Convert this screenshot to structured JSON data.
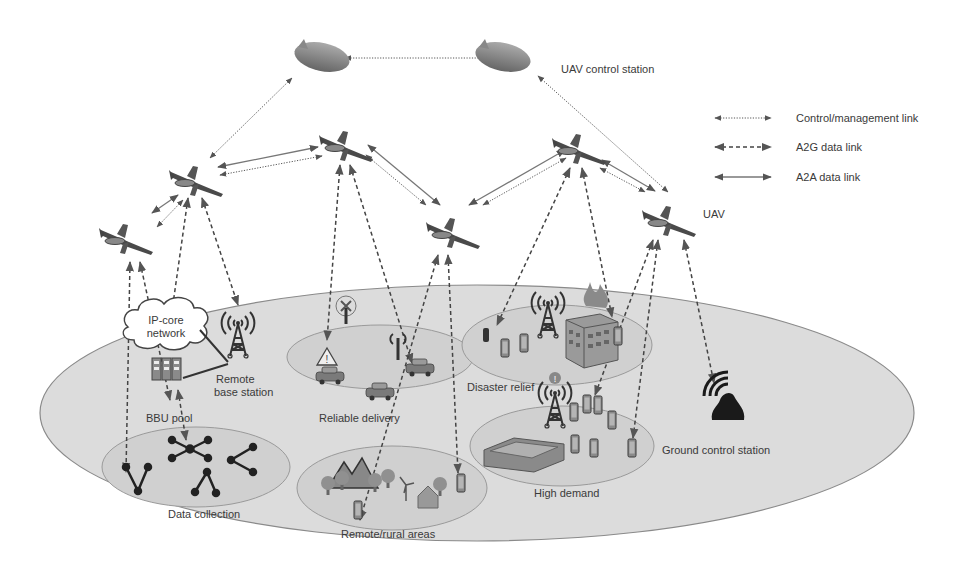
{
  "diagram": {
    "colors": {
      "ground_fill": "#dcdcdc",
      "ground_stroke": "#8a8a8a",
      "zone_fill": "#d0d0d0",
      "zone_stroke": "#9a9a9a",
      "link": "#555555",
      "icon_dark": "#3a3a3a",
      "icon_mid": "#7a7a7a",
      "text": "#3a3a3a"
    },
    "labels": {
      "uav_control_station": "UAV control station",
      "uav": "UAV",
      "ip_core_line1": "IP-core",
      "ip_core_line2": "network",
      "remote_base_station_line1": "Remote",
      "remote_base_station_line2": "base station",
      "bbu_pool": "BBU pool",
      "reliable_delivery": "Reliable delivery",
      "disaster_relief": "Disaster relief",
      "data_collection": "Data collection",
      "remote_rural_areas": "Remote/rural areas",
      "high_demand": "High demand",
      "ground_control_station": "Ground control station"
    },
    "legend": [
      {
        "type": "control",
        "label": "Control/management link"
      },
      {
        "type": "a2g",
        "label": "A2G data link"
      },
      {
        "type": "a2a",
        "label": "A2A data link"
      }
    ],
    "nodes": {
      "airships": [
        {
          "id": "airship-1",
          "x": 322,
          "y": 57
        },
        {
          "id": "airship-2",
          "x": 503,
          "y": 57
        }
      ],
      "uavs": [
        {
          "id": "uav-1",
          "x": 125,
          "y": 238
        },
        {
          "id": "uav-2",
          "x": 195,
          "y": 180
        },
        {
          "id": "uav-3",
          "x": 345,
          "y": 145
        },
        {
          "id": "uav-4",
          "x": 452,
          "y": 232
        },
        {
          "id": "uav-5",
          "x": 578,
          "y": 148
        },
        {
          "id": "uav-6",
          "x": 668,
          "y": 220
        }
      ]
    },
    "zones": [
      {
        "id": "reliable-delivery",
        "cx": 380,
        "cy": 357,
        "rx": 93,
        "ry": 32
      },
      {
        "id": "disaster-relief",
        "cx": 557,
        "cy": 345,
        "rx": 95,
        "ry": 40
      },
      {
        "id": "data-collection",
        "cx": 196,
        "cy": 467,
        "rx": 94,
        "ry": 40
      },
      {
        "id": "remote-rural",
        "cx": 392,
        "cy": 488,
        "rx": 95,
        "ry": 42
      },
      {
        "id": "high-demand",
        "cx": 562,
        "cy": 446,
        "rx": 92,
        "ry": 40
      }
    ],
    "links": [
      {
        "type": "control",
        "from": [
          345,
          58
        ],
        "to": [
          505,
          58
        ]
      },
      {
        "type": "control",
        "from": [
          292,
          78
        ],
        "to": [
          210,
          158
        ]
      },
      {
        "type": "control",
        "from": [
          538,
          76
        ],
        "to": [
          668,
          192
        ]
      },
      {
        "type": "a2a",
        "from": [
          218,
          167
        ],
        "to": [
          318,
          147
        ]
      },
      {
        "type": "control",
        "from": [
          220,
          175
        ],
        "to": [
          322,
          156
        ]
      },
      {
        "type": "a2a",
        "from": [
          178,
          195
        ],
        "to": [
          152,
          213
        ]
      },
      {
        "type": "control",
        "from": [
          183,
          200
        ],
        "to": [
          157,
          227
        ]
      },
      {
        "type": "a2a",
        "from": [
          368,
          145
        ],
        "to": [
          440,
          205
        ]
      },
      {
        "type": "control",
        "from": [
          366,
          155
        ],
        "to": [
          426,
          205
        ]
      },
      {
        "type": "a2a",
        "from": [
          565,
          150
        ],
        "to": [
          469,
          205
        ]
      },
      {
        "type": "control",
        "from": [
          566,
          158
        ],
        "to": [
          483,
          205
        ]
      },
      {
        "type": "a2a",
        "from": [
          602,
          160
        ],
        "to": [
          655,
          191
        ]
      },
      {
        "type": "control",
        "from": [
          600,
          168
        ],
        "to": [
          645,
          192
        ]
      },
      {
        "type": "a2g",
        "from": [
          130,
          262
        ],
        "to": [
          126,
          472
        ]
      },
      {
        "type": "a2g",
        "from": [
          140,
          262
        ],
        "to": [
          170,
          400
        ]
      },
      {
        "type": "a2g",
        "from": [
          188,
          198
        ],
        "to": [
          170,
          325
        ]
      },
      {
        "type": "a2g",
        "from": [
          202,
          198
        ],
        "to": [
          238,
          305
        ]
      },
      {
        "type": "a2g",
        "from": [
          178,
          390
        ],
        "to": [
          186,
          440
        ]
      },
      {
        "type": "a2g",
        "from": [
          340,
          165
        ],
        "to": [
          327,
          340
        ]
      },
      {
        "type": "a2g",
        "from": [
          350,
          165
        ],
        "to": [
          412,
          363
        ]
      },
      {
        "type": "a2g",
        "from": [
          438,
          255
        ],
        "to": [
          360,
          520
        ]
      },
      {
        "type": "a2g",
        "from": [
          448,
          255
        ],
        "to": [
          458,
          473
        ]
      },
      {
        "type": "a2g",
        "from": [
          570,
          168
        ],
        "to": [
          497,
          325
        ]
      },
      {
        "type": "a2g",
        "from": [
          582,
          168
        ],
        "to": [
          612,
          317
        ]
      },
      {
        "type": "a2g",
        "from": [
          653,
          240
        ],
        "to": [
          595,
          395
        ]
      },
      {
        "type": "a2g",
        "from": [
          658,
          240
        ],
        "to": [
          633,
          438
        ]
      },
      {
        "type": "a2g",
        "from": [
          684,
          240
        ],
        "to": [
          714,
          383
        ]
      }
    ]
  }
}
